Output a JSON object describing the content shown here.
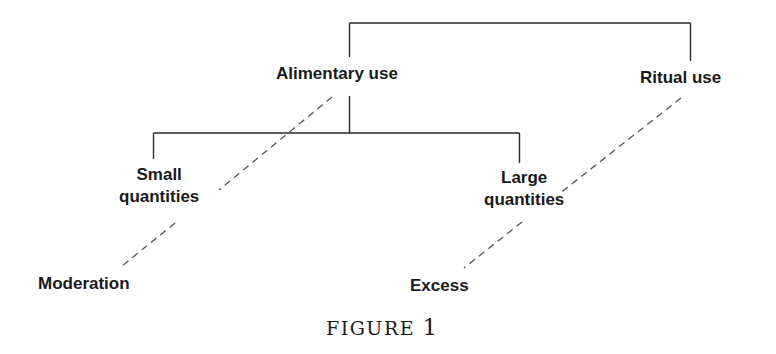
{
  "figure": {
    "caption_word": "FIGURE",
    "caption_number": "1"
  },
  "nodes": {
    "alimentary_use": "Alimentary use",
    "ritual_use": "Ritual use",
    "small_quantities": [
      "Small",
      "quantities"
    ],
    "large_quantities": [
      "Large",
      "quantities"
    ],
    "moderation": "Moderation",
    "excess": "Excess"
  },
  "edges": {
    "solid": [
      {
        "from": "root",
        "to": "alimentary_use"
      },
      {
        "from": "root",
        "to": "ritual_use"
      },
      {
        "from": "alimentary_use",
        "to": "small_quantities"
      },
      {
        "from": "alimentary_use",
        "to": "large_quantities"
      }
    ],
    "dashed": [
      {
        "from": "alimentary_use",
        "to": "moderation",
        "via": "small_quantities"
      },
      {
        "from": "ritual_use",
        "to": "excess",
        "via": "large_quantities"
      }
    ]
  },
  "colors": {
    "line": "#2a2a2a",
    "dashed": "#555555",
    "text": "#1a1a1a",
    "background": "#ffffff"
  }
}
